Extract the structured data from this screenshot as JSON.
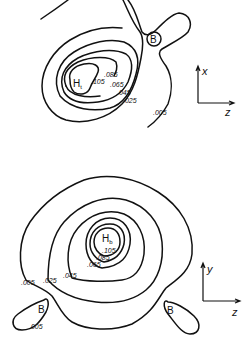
{
  "figure": {
    "type": "contour-diagram",
    "panels": [
      {
        "id": "top",
        "center_atom": {
          "symbol": "H",
          "subscript": "t"
        },
        "boron_labels": [
          "B"
        ],
        "contour_labels": [
          ".105",
          ".085",
          ".065",
          ".045",
          ".025",
          ".005"
        ],
        "axes": {
          "vertical": "x",
          "horizontal": "z"
        }
      },
      {
        "id": "bottom",
        "center_atom": {
          "symbol": "H",
          "subscript": "b"
        },
        "boron_labels": [
          "B",
          "B"
        ],
        "contour_labels": [
          ".105",
          ".085",
          ".065",
          ".045",
          ".025",
          ".005",
          ".005"
        ],
        "axes": {
          "vertical": "y",
          "horizontal": "z"
        }
      }
    ]
  }
}
